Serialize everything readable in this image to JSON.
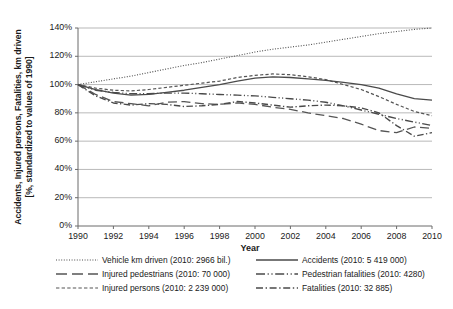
{
  "chart_data": {
    "type": "line",
    "title": "",
    "xlabel": "Year",
    "ylabel": "Accidents, Injured persons, Fatalities, km driven [%, standardized to values of 1990]",
    "ylabel_line1": "Accidents, Injured persons, Fatalities, km driven",
    "ylabel_line2": "[%, standardized to values of 1990]",
    "xlim": [
      1990,
      2010
    ],
    "ylim": [
      0,
      140
    ],
    "grid": true,
    "grid_axis": "y",
    "legend_position": "below-plot-two-columns",
    "xticks": [
      1990,
      1992,
      1994,
      1996,
      1998,
      2000,
      2002,
      2004,
      2006,
      2008,
      2010
    ],
    "xtick_labels": [
      "1990",
      "1992",
      "1994",
      "1996",
      "1998",
      "2000",
      "2002",
      "2004",
      "2006",
      "2008",
      "2010"
    ],
    "yticks": [
      0,
      20,
      40,
      60,
      80,
      100,
      120,
      140
    ],
    "ytick_labels": [
      "0%",
      "20%",
      "40%",
      "60%",
      "80%",
      "100%",
      "120%",
      "140%"
    ],
    "x": [
      1990,
      1991,
      1992,
      1993,
      1994,
      1995,
      1996,
      1997,
      1998,
      1999,
      2000,
      2001,
      2002,
      2003,
      2004,
      2005,
      2006,
      2007,
      2008,
      2009,
      2010
    ],
    "series": [
      {
        "name": "Vehicle km driven (2010: 2966 bil.)",
        "short_name": "Vehicle km driven",
        "value_2010_label": "2010: 2966 bil.",
        "style": "dotted",
        "color": "#4d4d4d",
        "values": [
          100,
          102,
          104,
          106,
          108.5,
          111,
          113.5,
          115.5,
          118,
          120.5,
          123,
          125,
          126.5,
          128,
          130,
          132,
          134,
          136,
          137.5,
          139,
          140
        ]
      },
      {
        "name": "Injured pedestrians (2010: 70 000)",
        "short_name": "Injured pedestrians",
        "value_2010_label": "2010: 70 000",
        "style": "long-dash",
        "color": "#555555",
        "values": [
          100,
          93,
          88,
          86.5,
          85,
          87.5,
          88,
          86.5,
          86,
          87,
          86,
          84,
          82.5,
          80,
          78,
          76,
          72,
          67.5,
          66,
          70,
          69
        ]
      },
      {
        "name": "Injured persons (2010: 2 239 000)",
        "short_name": "Injured persons",
        "value_2010_label": "2010: 2 239 000",
        "style": "short-dash",
        "color": "#555555",
        "values": [
          100,
          97.5,
          96,
          95.5,
          96.5,
          98,
          99.5,
          101,
          102.5,
          105,
          106.5,
          107.5,
          107,
          105.5,
          103.5,
          100,
          96.5,
          91.5,
          86,
          81,
          78
        ]
      },
      {
        "name": "Accidents (2010: 5 419 000)",
        "short_name": "Accidents",
        "value_2010_label": "2010: 5 419 000",
        "style": "solid",
        "color": "#4a4a4a",
        "values": [
          100,
          96.5,
          94,
          92.5,
          93,
          94.5,
          96,
          98,
          100,
          102.5,
          104.5,
          105.5,
          105,
          104,
          103,
          101.5,
          100,
          97.5,
          93.5,
          90,
          89
        ]
      },
      {
        "name": "Pedestrian fatalities (2010: 4280)",
        "short_name": "Pedestrian fatalities",
        "value_2010_label": "2010: 4280",
        "style": "dash-dot-dot",
        "color": "#4a4a4a",
        "values": [
          100,
          96,
          94.5,
          93.5,
          93.5,
          94,
          94,
          93.5,
          93,
          92.5,
          92,
          91,
          90,
          89,
          87.5,
          85,
          82,
          79,
          76,
          73.5,
          71
        ]
      },
      {
        "name": "Fatalities (2010: 32 885)",
        "short_name": "Fatalities",
        "value_2010_label": "2010: 32 885",
        "style": "dash-dot",
        "color": "#4a4a4a",
        "values": [
          100,
          92,
          87,
          85.5,
          86.5,
          86,
          84.5,
          85,
          86,
          88,
          87,
          85.5,
          84,
          85,
          85.5,
          85,
          83.5,
          80,
          71,
          63.5,
          66
        ]
      }
    ]
  },
  "axis": {
    "y_label_line1": "Accidents, Injured persons, Fatalities, km driven",
    "y_label_line2": "[%, standardized to values of 1990]",
    "x_title": "Year"
  },
  "legend": {
    "left_column": [
      "Vehicle km driven (2010: 2966 bil.)",
      "Injured pedestrians (2010: 70 000)",
      "Injured persons (2010: 2 239 000)"
    ],
    "right_column": [
      "Accidents (2010: 5 419 000)",
      "Pedestrian fatalities (2010: 4280)",
      "Fatalities (2010: 32 885)"
    ]
  }
}
